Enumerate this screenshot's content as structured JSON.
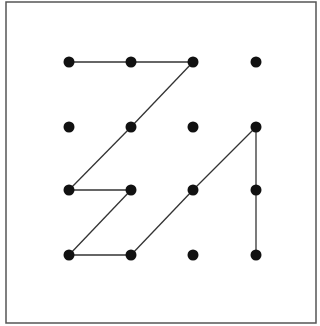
{
  "diagram": {
    "type": "dot-grid-path",
    "grid": {
      "columns": 4,
      "rows": 4
    },
    "frame": {
      "x": 6,
      "y": 2,
      "width": 310,
      "height": 321,
      "stroke": "#555555"
    },
    "column_x": [
      69,
      131,
      193,
      256
    ],
    "row_y": [
      62,
      127,
      190,
      255
    ],
    "dot_radius": 5.5,
    "dot_color": "#111111",
    "line_color": "#333333",
    "segments": [
      [
        [
          0,
          0
        ],
        [
          1,
          0
        ]
      ],
      [
        [
          1,
          0
        ],
        [
          2,
          0
        ]
      ],
      [
        [
          2,
          0
        ],
        [
          1,
          1
        ]
      ],
      [
        [
          1,
          1
        ],
        [
          0,
          2
        ]
      ],
      [
        [
          0,
          2
        ],
        [
          1,
          2
        ]
      ],
      [
        [
          1,
          2
        ],
        [
          0,
          3
        ]
      ],
      [
        [
          0,
          3
        ],
        [
          1,
          3
        ]
      ],
      [
        [
          1,
          3
        ],
        [
          2,
          2
        ]
      ],
      [
        [
          2,
          2
        ],
        [
          3,
          1
        ]
      ],
      [
        [
          3,
          1
        ],
        [
          3,
          2
        ]
      ],
      [
        [
          3,
          2
        ],
        [
          3,
          3
        ]
      ]
    ]
  }
}
